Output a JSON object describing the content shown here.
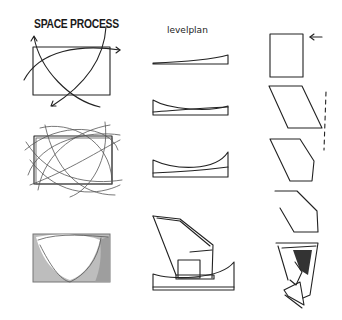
{
  "labels": {
    "title": "SPACE PROCESS",
    "subtitle": "levelplan"
  },
  "columns": [
    {
      "name": "space-process",
      "rows": 4
    },
    {
      "name": "levelplan",
      "rows": 4
    },
    {
      "name": "form-study",
      "rows": 5
    }
  ],
  "colors": {
    "stroke": "#222222",
    "fill_light": "#bdbdbd",
    "fill_mid": "#9e9e9e",
    "background": "#ffffff"
  }
}
